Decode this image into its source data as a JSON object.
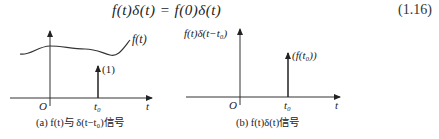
{
  "equation": {
    "text": "f(t)δ(t) = f(0)δ(t)",
    "number": "(1.16)"
  },
  "figures": [
    {
      "id": "a",
      "caption": "(a) f(t)与 δ(t−t₀)信号",
      "curve_label": "f(t)",
      "impulse_label": "(1)",
      "origin_label": "O",
      "t0_label": "t₀",
      "axis_label": "t"
    },
    {
      "id": "b",
      "caption": "(b) f(t)δ(t)信号",
      "y_axis_label": "f(t)δ(t−t₀)",
      "impulse_label": "(f(t₀))",
      "origin_label": "O",
      "t0_label": "t₀",
      "axis_label": "t"
    }
  ]
}
